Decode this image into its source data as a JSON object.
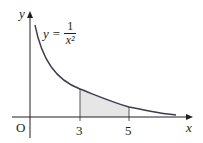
{
  "diagram": {
    "function_label": {
      "lhs": "y",
      "equals": "=",
      "numerator": "1",
      "denominator": "x²"
    },
    "axes": {
      "x_label": "x",
      "y_label": "y",
      "origin_label": "O"
    },
    "ticks": [
      {
        "label": "3"
      },
      {
        "label": "5"
      }
    ],
    "shaded_region": {
      "from": "3",
      "to": "5",
      "description": "area under y = 1/x² between x = 3 and x = 5"
    },
    "colors": {
      "curve": "#3d3b4f",
      "axes": "#231f20",
      "shade": "#e6e6e6"
    }
  }
}
